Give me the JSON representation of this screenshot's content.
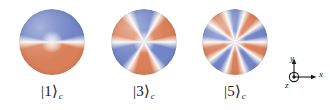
{
  "figure": {
    "background_color": "#ffffff",
    "colors": {
      "blue": "#7285c6",
      "blue_dark": "#5f72b4",
      "orange": "#d9805a",
      "orange_dark": "#c7704b",
      "white": "#fdfbf7",
      "ink": "#1a1a1a"
    },
    "spheres": [
      {
        "name": "sphere-cat-state-1",
        "label_ket": "|1⟩",
        "label_subscript": "c",
        "lobes": 1,
        "sectors": 2,
        "description": "Two-lobe (single-period) azimuthal phase pattern: blue left hemisphere, orange right hemisphere separated by a white band",
        "x": 19,
        "y": 9,
        "diameter": 66,
        "rotation_deg": 90
      },
      {
        "name": "sphere-cat-state-3",
        "label_ket": "|3⟩",
        "label_subscript": "c",
        "lobes": 3,
        "sectors": 6,
        "description": "Six alternating blue and orange sectors radiating from a bright core",
        "x": 111,
        "y": 9,
        "diameter": 66,
        "rotation_deg": 30
      },
      {
        "name": "sphere-cat-state-5",
        "label_ket": "|5⟩",
        "label_subscript": "c",
        "lobes": 5,
        "sectors": 10,
        "description": "Ten alternating blue and orange sectors radiating from a bright core",
        "x": 202,
        "y": 9,
        "diameter": 66,
        "rotation_deg": 18
      }
    ],
    "axes": {
      "name": "coordinate-triad",
      "y_label": "y",
      "x_label": "x",
      "z_label": "z",
      "z_note": "out-of-page (circled dot)"
    }
  }
}
